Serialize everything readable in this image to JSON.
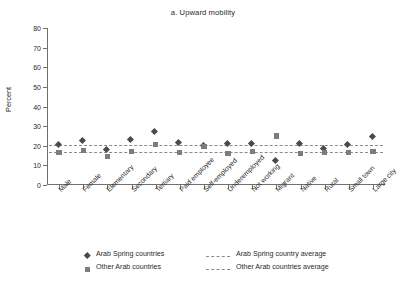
{
  "chart_data": {
    "type": "scatter",
    "title": "a. Upward mobility",
    "xlabel": "",
    "ylabel": "Percent",
    "ylim": [
      0,
      80
    ],
    "yticks": [
      0,
      10,
      20,
      30,
      40,
      50,
      60,
      70,
      80
    ],
    "ytick_labels": [
      "0",
      "10",
      "20",
      "30",
      "40",
      "50",
      "60",
      "70",
      "80"
    ],
    "grid": false,
    "legend_position": "bottom",
    "categories": [
      "Male",
      "Female",
      "Elementary",
      "Secondary",
      "Tertiary",
      "Paid employee",
      "Self-employed",
      "Underemployed",
      "Not working",
      "Migrant",
      "Native",
      "Rural",
      "Small town",
      "Large city"
    ],
    "series": [
      {
        "name": "Arab Spring countries",
        "marker": "diamond",
        "color": "#4a4a4a",
        "values": [
          20.0,
          22.0,
          17.5,
          22.5,
          27.0,
          21.0,
          19.5,
          20.5,
          20.5,
          12.0,
          20.5,
          18.0,
          20.0,
          24.5
        ]
      },
      {
        "name": "Other Arab countries",
        "marker": "square",
        "color": "#7d7d7d",
        "values": [
          16.5,
          17.5,
          14.5,
          17.0,
          20.5,
          16.5,
          19.5,
          16.0,
          17.0,
          25.0,
          16.0,
          16.5,
          16.5,
          17.0
        ]
      }
    ],
    "reference_lines": [
      {
        "name": "Arab Spring country average",
        "value": 20.5,
        "style": "dashed",
        "color": "#8a8a8a"
      },
      {
        "name": "Other Arab countries average",
        "value": 16.8,
        "style": "dashed",
        "color": "#8a8a8a"
      }
    ]
  },
  "legend": {
    "items": [
      {
        "marker_label": "Arab Spring countries",
        "line_label": "Arab Spring country average"
      },
      {
        "marker_label": "Other Arab countries",
        "line_label": "Other Arab countries average"
      }
    ]
  }
}
